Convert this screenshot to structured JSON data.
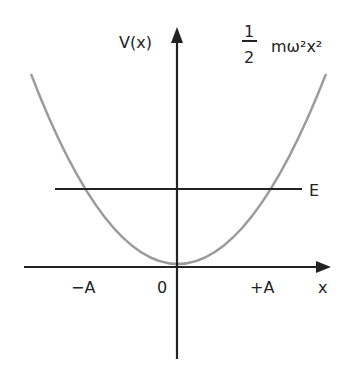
{
  "diagram": {
    "y_axis_label": "V(x)",
    "x_axis_label": "x",
    "energy_label": "E",
    "formula": {
      "numerator": "1",
      "denominator": "2",
      "expression": "mω²x²"
    },
    "x_ticks": {
      "left": "−A",
      "origin": "0",
      "right": "+A"
    },
    "colors": {
      "axes": "#222222",
      "curve": "#9a9a9a",
      "energy_line": "#222222",
      "background": "#ffffff"
    }
  }
}
